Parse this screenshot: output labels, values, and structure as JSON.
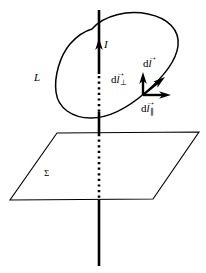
{
  "figure": {
    "stroke_color": "#000000",
    "background_color": "#ffffff",
    "labels": {
      "current": "I",
      "loop": "L",
      "surface": "Σ",
      "dl_perp_base": "d",
      "dl_perp_vec": "l",
      "dl_perp_arrow": "→",
      "dl_perp_sub": "⊥",
      "dl_base": "d",
      "dl_vec": "l",
      "dl_arrow": "→",
      "dl_par_base": "d",
      "dl_par_vec": "l",
      "dl_par_arrow": "→",
      "dl_par_sub": "∥"
    },
    "elements": {
      "axis_name": "current-carrying-wire",
      "loop_name": "closed-loop-L",
      "plane_name": "plane-sigma",
      "vector_origin": "element-point-on-loop"
    },
    "geometry": {
      "axis_x": 99,
      "axis_top": 10,
      "axis_bottom": 266,
      "plane_corners": "57,133 199,132 153,199 10,200",
      "vector_origin_x": 143,
      "vector_origin_y": 95
    }
  }
}
